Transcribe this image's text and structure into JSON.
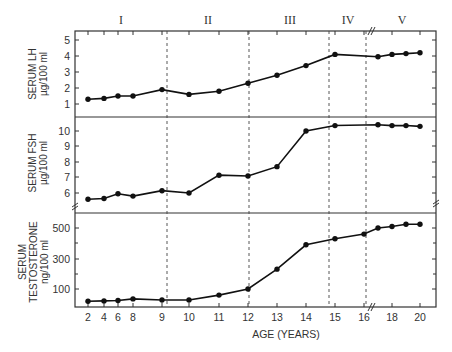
{
  "chart_data": [
    {
      "type": "line",
      "title": "Serum LH",
      "ylabel": "SERUM LH",
      "yunit": "µg/100 ml",
      "yticks": [
        1,
        2,
        3,
        4,
        5
      ],
      "ylim": [
        0,
        5.5
      ],
      "x": [
        2,
        4,
        6,
        8,
        9,
        10,
        11,
        12,
        13,
        14,
        15,
        16,
        17,
        18,
        19,
        20
      ],
      "values": [
        1.3,
        1.35,
        1.5,
        1.5,
        1.9,
        1.6,
        1.8,
        2.3,
        2.8,
        3.4,
        4.1,
        null,
        3.95,
        4.1,
        4.15,
        4.2
      ]
    },
    {
      "type": "line",
      "title": "Serum FSH",
      "ylabel": "SERUM FSH",
      "yunit": "µg/100 ml",
      "yticks": [
        6,
        7,
        8,
        9,
        10
      ],
      "ylim": [
        5,
        10.8
      ],
      "axis_break": true,
      "x": [
        2,
        4,
        6,
        8,
        9,
        10,
        11,
        12,
        13,
        14,
        15,
        16,
        17,
        18,
        19,
        20
      ],
      "values": [
        5.6,
        5.65,
        5.95,
        5.8,
        6.15,
        6.0,
        7.15,
        7.1,
        7.7,
        10.0,
        10.35,
        null,
        10.4,
        10.35,
        10.35,
        10.3
      ]
    },
    {
      "type": "line",
      "title": "Serum Testosterone",
      "ylabel": "SERUM TESTOSTERONE",
      "yunit": "ng/100 ml",
      "yticks": [
        100,
        300,
        500
      ],
      "yminor_ticks": [
        200,
        400
      ],
      "ylim": [
        0,
        600
      ],
      "x": [
        2,
        4,
        6,
        8,
        9,
        10,
        11,
        12,
        13,
        14,
        15,
        16,
        17,
        18,
        19,
        20
      ],
      "values": [
        20,
        22,
        25,
        35,
        28,
        28,
        60,
        100,
        230,
        390,
        430,
        460,
        500,
        510,
        525,
        525
      ]
    }
  ],
  "stages": [
    "I",
    "II",
    "III",
    "IV",
    "V"
  ],
  "xaxis": {
    "label": "AGE (YEARS)",
    "ticks": [
      "2",
      "4",
      "6",
      "8",
      "9",
      "10",
      "11",
      "12",
      "13",
      "14",
      "15",
      "16",
      "18",
      "20"
    ],
    "axis_break_between": [
      "16",
      "18"
    ]
  },
  "labels": {
    "lh_line1": "SERUM LH",
    "lh_line2": "µg/100 ml",
    "fsh_line1": "SERUM FSH",
    "fsh_line2": "µg/100 ml",
    "t_line1": "SERUM",
    "t_line2": "TESTOSTERONE",
    "t_line3": "ng/100 ml"
  },
  "colors": {
    "line": "#111111",
    "frame": "#333333",
    "text": "#333333"
  }
}
